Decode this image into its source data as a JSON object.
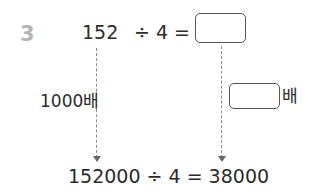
{
  "problem": {
    "number": "3",
    "top_equation": {
      "dividend": "152",
      "operator": "÷ 4 =",
      "answer_box": ""
    },
    "left_multiplier_label": "1000배",
    "right_multiplier": {
      "answer_box": "",
      "suffix": "배"
    },
    "bottom_equation": "152000 ÷ 4 = 38000"
  }
}
